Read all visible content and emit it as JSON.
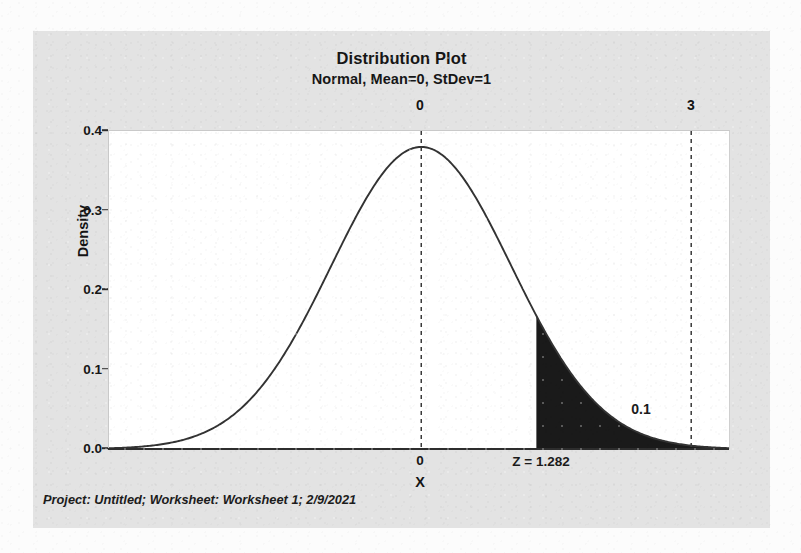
{
  "figure": {
    "title": "Distribution Plot",
    "subtitle": "Normal, Mean=0, StDev=1",
    "footer": "Project: Untitled; Worksheet: Worksheet 1; 2/9/2021",
    "panel_bg": "#e3e3e3",
    "plot_bg": "#ffffff",
    "curve_color": "#333333",
    "shade_color": "#1a1a1a",
    "ref_line_color": "#3a3a3a"
  },
  "chart_data": {
    "type": "area",
    "title": "Distribution Plot",
    "subtitle": "Normal, Mean=0, StDev=1",
    "distribution": "Normal",
    "mean": 0,
    "stdev": 1,
    "xlabel": "X",
    "ylabel": "Density",
    "xlim": [
      -3.47,
      3.42
    ],
    "ylim": [
      0.0,
      0.42
    ],
    "grid": false,
    "legend": false,
    "y_ticks": [
      "0.0",
      "0.1",
      "0.2",
      "0.3",
      "0.4"
    ],
    "y_tick_values": [
      0.0,
      0.1,
      0.2,
      0.3,
      0.4
    ],
    "x_ticks": [
      "0"
    ],
    "x_tick_values": [
      0
    ],
    "reference_lines": [
      {
        "label": "0",
        "value": 0,
        "style": "dashed"
      },
      {
        "label": "3",
        "value": 3,
        "style": "dashed"
      }
    ],
    "shaded_region": {
      "label": "0.1",
      "probability": 0.1,
      "from": 1.282,
      "to": "infinity",
      "tail": "upper",
      "annotation": "Z = 1.282",
      "z_value": 1.282
    },
    "peak_density": 0.3989,
    "curve_points": [
      {
        "x": -3.47,
        "y": 0.001
      },
      {
        "x": -3.0,
        "y": 0.0044
      },
      {
        "x": -2.5,
        "y": 0.0175
      },
      {
        "x": -2.0,
        "y": 0.054
      },
      {
        "x": -1.5,
        "y": 0.1295
      },
      {
        "x": -1.0,
        "y": 0.242
      },
      {
        "x": -0.5,
        "y": 0.3521
      },
      {
        "x": 0.0,
        "y": 0.3989
      },
      {
        "x": 0.5,
        "y": 0.3521
      },
      {
        "x": 1.0,
        "y": 0.242
      },
      {
        "x": 1.282,
        "y": 0.1754
      },
      {
        "x": 1.5,
        "y": 0.1295
      },
      {
        "x": 2.0,
        "y": 0.054
      },
      {
        "x": 2.5,
        "y": 0.0175
      },
      {
        "x": 3.0,
        "y": 0.0044
      },
      {
        "x": 3.42,
        "y": 0.0012
      }
    ]
  },
  "axes": {
    "y_title": "Density",
    "x_title": "X"
  }
}
